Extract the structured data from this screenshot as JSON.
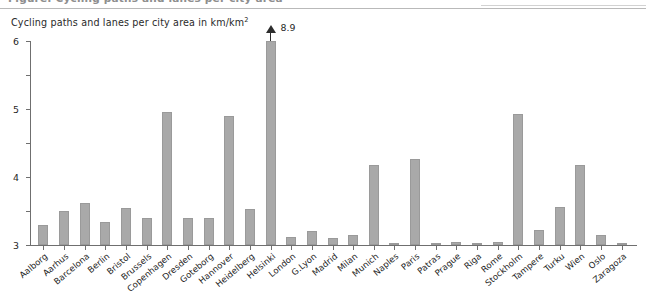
{
  "header": {
    "cut_off_text": "Figure: Cycling paths and lanes per city area"
  },
  "chart_data": {
    "type": "bar",
    "title": "Cycling paths and lanes per city area in km/km",
    "title_superscript": "2",
    "xlabel": "",
    "ylabel": "",
    "ylim": [
      0,
      6
    ],
    "yticks": [
      0,
      1,
      2,
      3,
      4,
      5,
      6
    ],
    "ytick_labels": [
      "0",
      "1",
      "2",
      "3",
      "4",
      "5",
      "6"
    ],
    "grid": false,
    "legend": null,
    "bar_color": "#a9a9a9",
    "axis_color": "#6f6f6f",
    "categories": [
      "Aalborg",
      "Aarhus",
      "Barcelona",
      "Berlin",
      "Bristol",
      "Brussels",
      "Copenhagen",
      "Dresden",
      "Goteborg",
      "Hannover",
      "Heidelberg",
      "Helsinki",
      "London",
      "G.Lyon",
      "Madrid",
      "Milan",
      "Munich",
      "Naples",
      "Paris",
      "Patras",
      "Prague",
      "Riga",
      "Rome",
      "Stockholm",
      "Tampere",
      "Turku",
      "Wien",
      "Oslo",
      "Zaragoza"
    ],
    "values": [
      0.58,
      1.0,
      1.25,
      0.68,
      1.08,
      0.78,
      3.9,
      0.78,
      0.78,
      3.78,
      1.05,
      8.9,
      0.25,
      0.42,
      0.2,
      0.3,
      2.35,
      0.02,
      2.52,
      0.02,
      0.1,
      0.06,
      0.08,
      3.85,
      0.45,
      1.12,
      2.35,
      0.3,
      0.03
    ],
    "annotations": [
      {
        "category": "Helsinki",
        "value": 8.9,
        "label": "8.9",
        "note": "bar truncated at axis maximum with up-arrow"
      }
    ]
  }
}
